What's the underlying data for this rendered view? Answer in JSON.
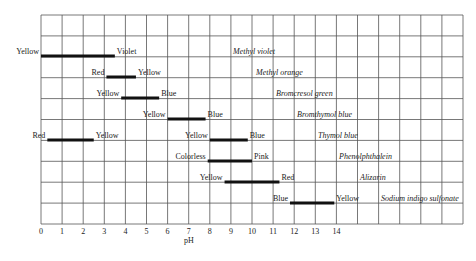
{
  "chart_data": {
    "type": "range-bar",
    "title": "",
    "xlabel": "pH",
    "ylabel": "",
    "xlim": [
      0,
      20
    ],
    "x_ticks": [
      0,
      1,
      2,
      3,
      4,
      5,
      6,
      7,
      8,
      9,
      10,
      11,
      12,
      13,
      14
    ],
    "grid": true,
    "series": [
      {
        "name": "Methyl violet",
        "low_color": "Yellow",
        "high_color": "Violet",
        "start": 0.0,
        "end": 3.5
      },
      {
        "name": "Methyl orange",
        "low_color": "Red",
        "high_color": "Yellow",
        "start": 3.1,
        "end": 4.5
      },
      {
        "name": "Bromcresol green",
        "low_color": "Yellow",
        "high_color": "Blue",
        "start": 3.8,
        "end": 5.6
      },
      {
        "name": "Bromthymol blue",
        "low_color": "Yellow",
        "high_color": "Blue",
        "start": 6.0,
        "end": 7.8
      },
      {
        "name": "Thymol blue",
        "low_color": "Red",
        "high_color": "Yellow",
        "start": 0.3,
        "end": 2.5,
        "second_range": {
          "low_color": "Yellow",
          "high_color": "Blue",
          "start": 8.0,
          "end": 9.8
        }
      },
      {
        "name": "Phenolphthalein",
        "low_color": "Colorless",
        "high_color": "Pink",
        "start": 7.9,
        "end": 10.0
      },
      {
        "name": "Alizarin",
        "low_color": "Yellow",
        "high_color": "Red",
        "start": 8.7,
        "end": 11.3
      },
      {
        "name": "Sodium indigo sulfonate",
        "low_color": "Blue",
        "high_color": "Yellow",
        "start": 11.8,
        "end": 13.9
      }
    ]
  }
}
